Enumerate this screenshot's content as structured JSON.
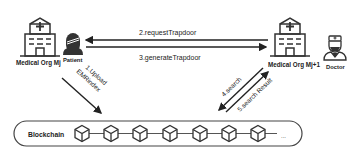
{
  "nodes": {
    "org_left": {
      "label": "Medical Org Mj"
    },
    "patient": {
      "label": "Patient"
    },
    "org_right": {
      "label": "Medical Org Mj+1"
    },
    "doctor": {
      "label": "Doctor"
    }
  },
  "edges": [
    {
      "id": "e1",
      "label_line1": "1.Upload",
      "label_line2": "EMRindex"
    },
    {
      "id": "e2",
      "label": "2.requestTrapdoor"
    },
    {
      "id": "e3",
      "label": "3.generateTrapdoor"
    },
    {
      "id": "e4",
      "label": "4.search"
    },
    {
      "id": "e5",
      "label": "5.search Result"
    }
  ],
  "blockchain": {
    "label": "Blockchain",
    "block_count": 7,
    "ellipsis": "..."
  }
}
